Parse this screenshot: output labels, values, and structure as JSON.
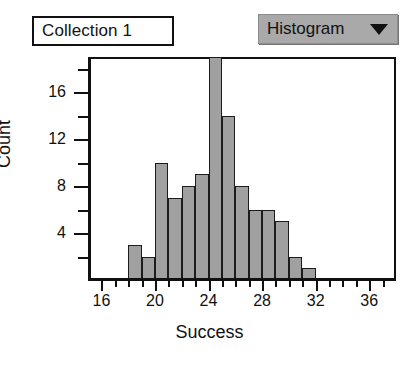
{
  "window": {
    "collection_label": "Collection 1",
    "plot_type_menu": {
      "label": "Histogram",
      "arrow_icon": "chevron-down-icon"
    }
  },
  "colors": {
    "bar_fill": "#a0a0a0",
    "bar_stroke": "#1c1c1c",
    "frame": "#111111",
    "menu_background": "#a9a9a9",
    "page_background": "#ffffff"
  },
  "chart_data": {
    "type": "bar",
    "subtype": "histogram",
    "title": "",
    "xlabel": "Success",
    "ylabel": "Count",
    "bin_width": 1,
    "xlim": [
      15,
      38
    ],
    "ylim": [
      0,
      19
    ],
    "grid": false,
    "legend": null,
    "x_ticks_major": [
      16,
      20,
      24,
      28,
      32,
      36
    ],
    "x_tick_labels": [
      "16",
      "20",
      "24",
      "28",
      "32",
      "36"
    ],
    "x_ticks_minor": [
      17,
      18,
      19,
      21,
      22,
      23,
      25,
      26,
      27,
      29,
      30,
      31,
      33,
      34,
      35,
      37
    ],
    "y_ticks_major": [
      4,
      8,
      12,
      16
    ],
    "y_tick_labels": [
      "4",
      "8",
      "12",
      "16"
    ],
    "y_ticks_minor": [
      2,
      6,
      10,
      14,
      18
    ],
    "note": "Tallest bar (bin 24-25) is clipped by the plot frame top.",
    "bins": [
      {
        "start": 18,
        "end": 19,
        "count": 3
      },
      {
        "start": 19,
        "end": 20,
        "count": 2
      },
      {
        "start": 20,
        "end": 21,
        "count": 10
      },
      {
        "start": 21,
        "end": 22,
        "count": 7
      },
      {
        "start": 22,
        "end": 23,
        "count": 8
      },
      {
        "start": 23,
        "end": 24,
        "count": 9
      },
      {
        "start": 24,
        "end": 25,
        "count": 19
      },
      {
        "start": 25,
        "end": 26,
        "count": 14
      },
      {
        "start": 26,
        "end": 27,
        "count": 8
      },
      {
        "start": 27,
        "end": 28,
        "count": 6
      },
      {
        "start": 28,
        "end": 29,
        "count": 6
      },
      {
        "start": 29,
        "end": 30,
        "count": 5
      },
      {
        "start": 30,
        "end": 31,
        "count": 2
      },
      {
        "start": 31,
        "end": 32,
        "count": 1
      }
    ],
    "categories": [
      "18-19",
      "19-20",
      "20-21",
      "21-22",
      "22-23",
      "23-24",
      "24-25",
      "25-26",
      "26-27",
      "27-28",
      "28-29",
      "29-30",
      "30-31",
      "31-32"
    ],
    "values": [
      3,
      2,
      10,
      7,
      8,
      9,
      19,
      14,
      8,
      6,
      6,
      5,
      2,
      1
    ]
  }
}
